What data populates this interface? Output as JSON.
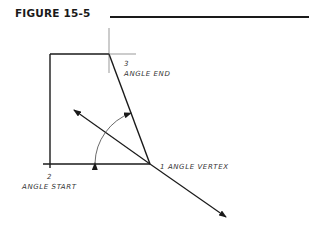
{
  "figure": {
    "title": "FIGURE 15-5"
  },
  "labels": {
    "vertex": "1  ANGLE VERTEX",
    "start_num": "2",
    "start": "ANGLE START",
    "end_num": "3",
    "end": "ANGLE END"
  },
  "colors": {
    "ink": "#1a1a1a",
    "background": "#ffffff"
  }
}
